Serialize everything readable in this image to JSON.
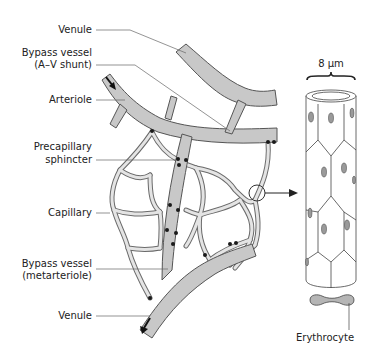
{
  "diagram": {
    "labels": {
      "venule_top": "Venule",
      "bypass_av_1": "Bypass vessel",
      "bypass_av_2": "(A–V shunt)",
      "arteriole": "Arteriole",
      "precap_1": "Precapillary",
      "precap_2": "sphincter",
      "capillary": "Capillary",
      "bypass_meta_1": "Bypass vessel",
      "bypass_meta_2": "(metarteriole)",
      "venule_bottom": "Venule",
      "scale": "8 µm",
      "erythrocyte": "Erythrocyte"
    },
    "colors": {
      "vessel_fill": "#c8c8c8",
      "vessel_stroke": "#555555",
      "capillary_fill": "#e4e4e4",
      "sphincter": "#1a1a1a",
      "leader_line": "#666666",
      "text": "#222222"
    },
    "icons": {
      "flow_in": "arrow-down-right-icon",
      "flow_out": "arrow-down-left-icon",
      "magnify": "magnifier-circle-icon",
      "pointer": "arrow-right-icon"
    }
  }
}
